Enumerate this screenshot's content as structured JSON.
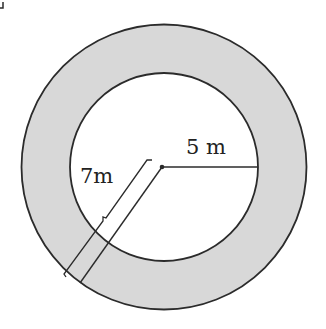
{
  "diagram": {
    "type": "annulus",
    "colors": {
      "ring_fill": "#d8d8d8",
      "stroke": "#2b2b2b",
      "inner_fill": "#ffffff"
    },
    "labels": {
      "inner_radius": "5 m",
      "outer_radius": "7m"
    },
    "measurements": {
      "inner_radius_m": 5,
      "outer_radius_m": 7
    }
  }
}
